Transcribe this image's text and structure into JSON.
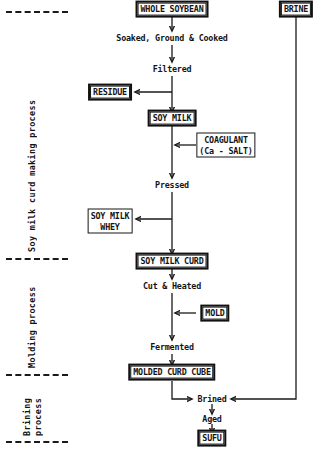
{
  "diagram": {
    "accent_color": "#1a1a1a",
    "background_color": "#ffffff",
    "sections": [
      {
        "id": "soy-milk-curd",
        "label": "Soy milk curd making process"
      },
      {
        "id": "molding",
        "label": "Molding process"
      },
      {
        "id": "brining",
        "label": "Brining",
        "label2": "process"
      }
    ],
    "nodes": {
      "whole_soybean": "WHOLE SOYBEAN",
      "brine": "BRINE",
      "soaked_ground_cooked": "Soaked, Ground & Cooked",
      "filtered": "Filtered",
      "residue": "RESIDUE",
      "soy_milk": "SOY MILK",
      "coagulant_line1": "COAGULANT",
      "coagulant_line2": "(Ca - SALT)",
      "pressed": "Pressed",
      "soy_milk_whey_line1": "SOY MILK",
      "soy_milk_whey_line2": "WHEY",
      "soy_milk_curd": "SOY MILK CURD",
      "cut_and_heated": "Cut & Heated",
      "mold": "MOLD",
      "fermented": "Fermented",
      "molded_curd_cube": "MOLDED CURD CUBE",
      "brined": "Brined",
      "aged": "Aged",
      "sufu": "SUFU"
    }
  }
}
